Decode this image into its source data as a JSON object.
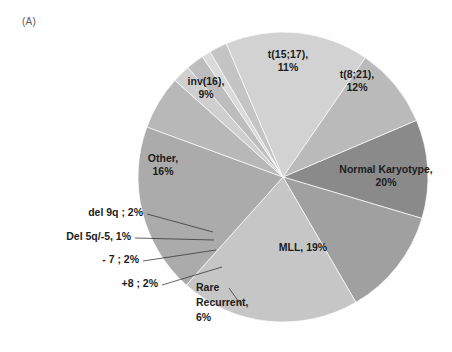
{
  "panel": {
    "label": "(A)"
  },
  "chart_data": {
    "type": "pie",
    "title": "",
    "subtitle": "",
    "xlabel": "",
    "ylabel": "",
    "legend": "none",
    "grid": false,
    "total_percent": 100,
    "start_angle_deg": -23,
    "direction": "clockwise",
    "categories": [
      "t(15;17)",
      "t(8;21)",
      "Normal Karyotype",
      "MLL",
      "Rare Recurrent",
      "+8",
      "- 7",
      "Del 5q/-5",
      "del 9q",
      "Other",
      "inv(16)"
    ],
    "values": [
      11,
      12,
      20,
      19,
      6,
      2,
      2,
      1,
      2,
      16,
      9
    ],
    "slices": [
      {
        "key": "t1517",
        "name": "t(15;17)",
        "value": 11,
        "label_line1": "t(15;17),",
        "label_line2": "11%",
        "color": "#8a8a8a",
        "label_mode": "inside"
      },
      {
        "key": "t821",
        "name": "t(8;21)",
        "value": 12,
        "label_line1": "t(8;21),",
        "label_line2": "12%",
        "color": "#a0a0a0",
        "label_mode": "inside"
      },
      {
        "key": "normal_karyotype",
        "name": "Normal Karyotype",
        "value": 20,
        "label_line1": "Normal Karyotype,",
        "label_line2": "20%",
        "color": "#c6c6c6",
        "label_mode": "inside"
      },
      {
        "key": "mll",
        "name": "MLL",
        "value": 19,
        "label_line1": "MLL, 19%",
        "label_line2": "",
        "color": "#ababab",
        "label_mode": "inside"
      },
      {
        "key": "rare_recurrent",
        "name": "Rare Recurrent",
        "value": 6,
        "label_line1": "Rare",
        "label_line2": "Recurrent,",
        "label_line3": "6%",
        "color": "#b8b8b8",
        "label_mode": "callout"
      },
      {
        "key": "plus8",
        "name": "+8",
        "value": 2,
        "label_line1": "+8 ; 2%",
        "label_line2": "",
        "color": "#cfcfcf",
        "label_mode": "callout"
      },
      {
        "key": "minus7",
        "name": "- 7",
        "value": 2,
        "label_line1": "- 7 ; 2%",
        "label_line2": "",
        "color": "#bdbdbd",
        "label_mode": "callout"
      },
      {
        "key": "del5q",
        "name": "Del 5q/-5",
        "value": 1,
        "label_line1": "Del 5q/-5, 1%",
        "label_line2": "",
        "color": "#dadada",
        "label_mode": "callout"
      },
      {
        "key": "del9q",
        "name": "del 9q",
        "value": 2,
        "label_line1": "del 9q ; 2%",
        "label_line2": "",
        "color": "#c4c4c4",
        "label_mode": "callout"
      },
      {
        "key": "other",
        "name": "Other",
        "value": 16,
        "label_line1": "Other,",
        "label_line2": "16%",
        "color": "#d2d2d2",
        "label_mode": "inside"
      },
      {
        "key": "inv16",
        "name": "inv(16)",
        "value": 9,
        "label_line1": "inv(16),",
        "label_line2": "9%",
        "color": "#bababa",
        "label_mode": "inside"
      }
    ]
  },
  "geometry": {
    "center_x": 283,
    "center_y": 177,
    "radius": 145
  },
  "colors": {
    "background": "#fefefe",
    "text": "#1d1d1d",
    "panel_label": "#5a5a5a",
    "leader_line": "#3a3a3a",
    "slice_border": "#fdfdfd"
  }
}
